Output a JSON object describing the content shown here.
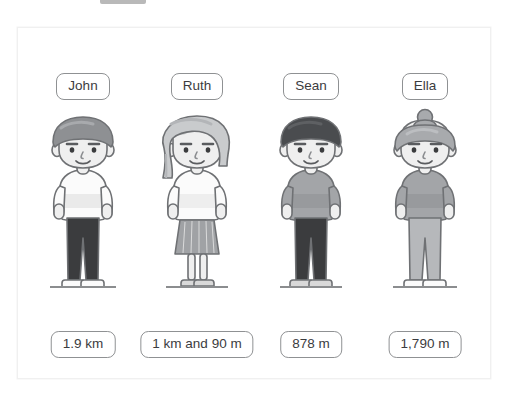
{
  "scene": {
    "background_color": "#ffffff",
    "card_border_color": "#f0f0f0",
    "top_stub": {
      "name": "top-gray-bar",
      "color": "#b9b9b9"
    }
  },
  "people": [
    {
      "name": "John",
      "value": "1.9 km",
      "avatar_icon": "boy-short-gray-hair-avatar",
      "colors": {
        "hair": "#8e9093",
        "hair_shade": "#a8aaad",
        "skin": "#efefef",
        "shirt": "#fbfbfb",
        "shirt_shade": "#dcdcdc",
        "pants": "#3b3c3e",
        "shoes": "#fbfbfb",
        "outline": "#6f7174"
      },
      "hair_style": "short",
      "bottom_style": "pants",
      "ground_width": 66
    },
    {
      "name": "Ruth",
      "value": "1 km and 90 m",
      "avatar_icon": "girl-long-hair-skirt-avatar",
      "colors": {
        "hair": "#c9cbcd",
        "hair_shade": "#b3b5b8",
        "skin": "#efefef",
        "shirt": "#fbfbfb",
        "shirt_shade": "#e4e4e4",
        "pants": "#a0a2a5",
        "shoes": "#d9d9d9",
        "outline": "#6f7174"
      },
      "hair_style": "long",
      "bottom_style": "skirt",
      "ground_width": 62
    },
    {
      "name": "Sean",
      "value": "878 m",
      "avatar_icon": "boy-dark-hair-avatar",
      "colors": {
        "hair": "#4a4c4f",
        "hair_shade": "#5e6063",
        "skin": "#efefef",
        "shirt": "#a3a5a8",
        "shirt_shade": "#8f9194",
        "pants": "#3b3c3e",
        "shoes": "#d9d9d9",
        "outline": "#6f7174"
      },
      "hair_style": "short",
      "bottom_style": "pants",
      "ground_width": 62
    },
    {
      "name": "Ella",
      "value": "1,790 m",
      "avatar_icon": "girl-top-bun-avatar",
      "colors": {
        "hair": "#a8aaad",
        "hair_shade": "#bcbec1",
        "skin": "#efefef",
        "shirt": "#a3a5a8",
        "shirt_shade": "#8f9194",
        "pants": "#b6b8bb",
        "shoes": "#fbfbfb",
        "outline": "#6f7174"
      },
      "hair_style": "bun",
      "bottom_style": "pants",
      "ground_width": 64
    }
  ]
}
